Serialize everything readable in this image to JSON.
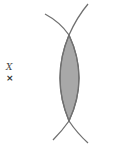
{
  "diagram": {
    "labels": {
      "variable": "X",
      "marker": "×"
    },
    "colors": {
      "stroke": "#707070",
      "fill": "#a8a8a8",
      "background": "#ffffff"
    },
    "shapes": [
      {
        "name": "arc-left-bulging-right",
        "description": "arc from top-left to bottom-left bulging right"
      },
      {
        "name": "arc-right-bulging-left",
        "description": "arc from top-right to bottom-right bulging left"
      },
      {
        "name": "lens-intersection",
        "description": "shaded overlap region between the arcs"
      }
    ]
  }
}
